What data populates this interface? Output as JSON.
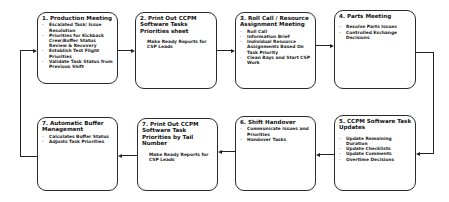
{
  "diagram": {
    "boxes": [
      {
        "title": "1.  Production Meeting",
        "items": [
          "Escalated Task/ Issue Resolution",
          "Priorities for Kickback Crew\\Buffer Status Review & Recovery",
          "Establish Test Flight Priorities",
          "Validate Task Status from Previous Shift"
        ]
      },
      {
        "title": "2.  Print Out CCPM Software Tasks Priorities sheet",
        "items": [
          "Make Ready Reports for CSP Leads"
        ]
      },
      {
        "title": "3.  Roll Call / Resource Assignment Meeting",
        "items": [
          "Roll Call",
          "Information Brief",
          "Individual Resource Assignments Based On Task Priority",
          "Clean Bays and Start CSP Work"
        ]
      },
      {
        "title": "4.  Parts Meeting",
        "items": [
          "Resolve Parts Issues",
          "Controlled Exchange Decisions"
        ]
      },
      {
        "title": "5.  CCPM Software Task Updates",
        "items": [
          "Update Remaining Duration",
          "Update Checklists",
          "Update Comments",
          "Overtime Decisions"
        ]
      },
      {
        "title": "6.  Shift Handover",
        "items": [
          "Communicate Issues and Priorities",
          "Handover Tasks"
        ]
      },
      {
        "title": "7. Print Out CCPM Software Task Priorities by Tail Number",
        "items": [
          "Make Ready Reports for CSP Leads"
        ]
      },
      {
        "title": "7. Automatic Buffer Management",
        "items": [
          "Calculates Buffer Status",
          "Adjusts Task Priorities"
        ]
      }
    ],
    "colors": {
      "line": "#222222",
      "border": "#2a2a2a",
      "background": "#ffffff"
    }
  }
}
